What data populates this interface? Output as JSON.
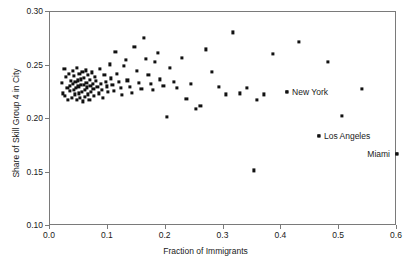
{
  "chart_data": {
    "type": "scatter",
    "title": "",
    "xlabel": "Fraction of Immigrants",
    "ylabel": "Share of Skill Group 4 in City",
    "xlim": [
      0.0,
      0.6
    ],
    "ylim": [
      0.1,
      0.3
    ],
    "xticks": [
      "0.0",
      "0.1",
      "0.2",
      "0.3",
      "0.4",
      "0.5",
      "0.6"
    ],
    "xtick_values": [
      0.0,
      0.1,
      0.2,
      0.3,
      0.4,
      0.5,
      0.6
    ],
    "yticks": [
      "0.10",
      "0.15",
      "0.20",
      "0.25",
      "0.30"
    ],
    "ytick_values": [
      0.1,
      0.15,
      0.2,
      0.25,
      0.3
    ],
    "grid": false,
    "legend": "none",
    "marker": "square",
    "marker_color": "#111111",
    "frame_color": "#7a7a7a",
    "x": [
      0.02,
      0.022,
      0.025,
      0.026,
      0.028,
      0.03,
      0.031,
      0.033,
      0.034,
      0.035,
      0.036,
      0.038,
      0.039,
      0.04,
      0.041,
      0.042,
      0.043,
      0.044,
      0.045,
      0.046,
      0.047,
      0.048,
      0.049,
      0.05,
      0.051,
      0.052,
      0.053,
      0.054,
      0.055,
      0.056,
      0.057,
      0.058,
      0.059,
      0.06,
      0.061,
      0.062,
      0.063,
      0.064,
      0.065,
      0.066,
      0.068,
      0.069,
      0.07,
      0.071,
      0.072,
      0.074,
      0.075,
      0.076,
      0.078,
      0.08,
      0.082,
      0.084,
      0.086,
      0.088,
      0.09,
      0.092,
      0.094,
      0.096,
      0.098,
      0.1,
      0.103,
      0.106,
      0.108,
      0.11,
      0.113,
      0.116,
      0.119,
      0.122,
      0.125,
      0.128,
      0.131,
      0.134,
      0.138,
      0.142,
      0.146,
      0.15,
      0.154,
      0.158,
      0.162,
      0.166,
      0.17,
      0.174,
      0.178,
      0.182,
      0.186,
      0.19,
      0.196,
      0.202,
      0.208,
      0.214,
      0.22,
      0.228,
      0.236,
      0.244,
      0.252,
      0.26,
      0.27,
      0.28,
      0.292,
      0.304,
      0.316,
      0.328,
      0.34,
      0.352,
      0.358,
      0.37,
      0.385,
      0.41,
      0.43,
      0.465,
      0.48,
      0.505,
      0.54,
      0.6
    ],
    "y": [
      0.2335,
      0.224,
      0.2465,
      0.2215,
      0.239,
      0.229,
      0.218,
      0.242,
      0.231,
      0.2265,
      0.2355,
      0.2195,
      0.245,
      0.233,
      0.2275,
      0.24,
      0.223,
      0.2345,
      0.229,
      0.2175,
      0.248,
      0.236,
      0.2305,
      0.224,
      0.242,
      0.22,
      0.237,
      0.2315,
      0.2255,
      0.244,
      0.2165,
      0.2385,
      0.232,
      0.227,
      0.2205,
      0.2455,
      0.234,
      0.2295,
      0.223,
      0.241,
      0.218,
      0.2365,
      0.231,
      0.225,
      0.2435,
      0.2325,
      0.2285,
      0.2215,
      0.2395,
      0.2355,
      0.23,
      0.224,
      0.247,
      0.233,
      0.227,
      0.2195,
      0.2415,
      0.2345,
      0.2305,
      0.2255,
      0.251,
      0.238,
      0.232,
      0.2265,
      0.263,
      0.2425,
      0.235,
      0.229,
      0.2225,
      0.2495,
      0.255,
      0.236,
      0.23,
      0.2245,
      0.267,
      0.245,
      0.234,
      0.2285,
      0.2755,
      0.256,
      0.241,
      0.233,
      0.2275,
      0.253,
      0.262,
      0.237,
      0.231,
      0.202,
      0.248,
      0.235,
      0.229,
      0.257,
      0.219,
      0.233,
      0.2095,
      0.212,
      0.265,
      0.244,
      0.23,
      0.223,
      0.281,
      0.224,
      0.229,
      0.152,
      0.218,
      0.223,
      0.2605,
      0.225,
      0.272,
      0.1845,
      0.253,
      0.203,
      0.2285,
      0.167
    ],
    "annotations": [
      {
        "label": "New York",
        "x": 0.41,
        "y": 0.225,
        "align": "right"
      },
      {
        "label": "Los Angeles",
        "x": 0.465,
        "y": 0.1845,
        "align": "right"
      },
      {
        "label": "Miami",
        "x": 0.6,
        "y": 0.167,
        "align": "left"
      }
    ]
  }
}
